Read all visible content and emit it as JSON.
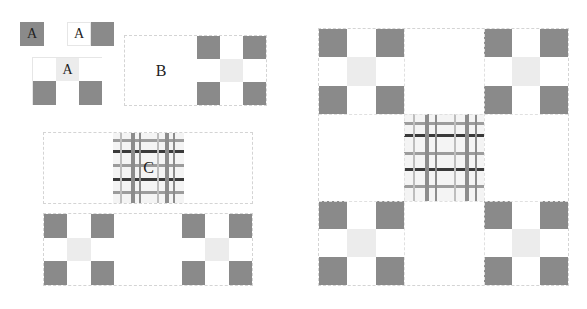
{
  "diagram": {
    "type": "recursive block composition",
    "labels": {
      "a1": "A",
      "a2": "A",
      "a3": "A",
      "b": "B",
      "c": "C"
    },
    "colors": {
      "dark_block": "#8a8a8a",
      "light_block": "#ececec",
      "white_block": "#ffffff",
      "frame_border": "#d4d4d4",
      "grid_dark_line": "#3a3a3a",
      "grid_mid_line": "#8c8c8c",
      "grid_light_line": "#bdbdbd"
    },
    "pattern_3x3": [
      "dark",
      "white",
      "dark",
      "white",
      "light",
      "white",
      "dark",
      "white",
      "dark"
    ],
    "parts": [
      {
        "id": "a1",
        "desc": "single dark tile labeled A"
      },
      {
        "id": "a2",
        "desc": "white tile labeled A next to dark tile"
      },
      {
        "id": "a3",
        "desc": "2x3 block with light center tile labeled A"
      },
      {
        "id": "b",
        "desc": "white half labeled B plus 3x3 pattern"
      },
      {
        "id": "c",
        "desc": "wide strip with central grid patch labeled C"
      },
      {
        "id": "strip",
        "desc": "wide strip with two 3x3 patterns"
      },
      {
        "id": "full",
        "desc": "full composite: four 3x3 corners and central grid"
      }
    ]
  }
}
